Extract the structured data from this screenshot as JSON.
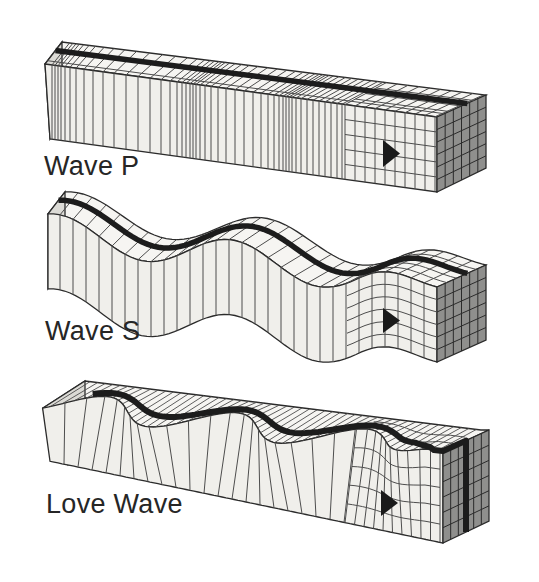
{
  "waves": [
    {
      "id": "wave-p",
      "label": "Wave P",
      "arrow_icon": "right-arrowhead-icon",
      "marker_icon": "dark-marker-stripe"
    },
    {
      "id": "wave-s",
      "label": "Wave S",
      "arrow_icon": "right-arrowhead-icon",
      "marker_icon": "dark-marker-stripe"
    },
    {
      "id": "love-wave",
      "label": "Love Wave",
      "arrow_icon": "right-arrowhead-icon",
      "marker_icon": "dark-marker-stripe"
    }
  ],
  "colors": {
    "background": "#ffffff",
    "outline": "#2b2b2b",
    "grid_line": "#4d4d4d",
    "face_front": "#f0efeb",
    "face_top": "#f6f5f2",
    "face_side": "#dcdbd6",
    "face_end": "#8f8f8d",
    "end_grid_line": "#2b2b2b",
    "marker_stripe": "#1c1c1c",
    "arrow": "#1a1a1a",
    "label_text": "#262626"
  }
}
